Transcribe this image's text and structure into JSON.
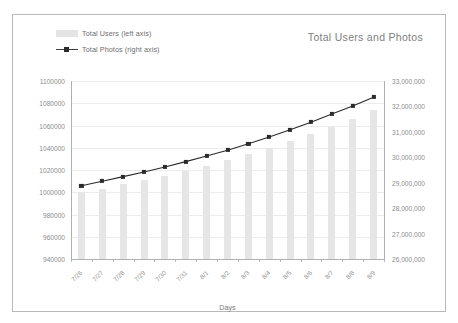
{
  "chart_data": {
    "type": "bar",
    "title": "Total Users and Photos",
    "xlabel": "Days",
    "ylabel": "",
    "grid": true,
    "legend_position": "top-left",
    "categories": [
      "7/26",
      "7/27",
      "7/28",
      "7/29",
      "7/30",
      "7/31",
      "8/1",
      "8/2",
      "8/3",
      "8/4",
      "8/5",
      "8/6",
      "8/7",
      "8/8",
      "8/9"
    ],
    "left_axis": {
      "label": "Total Users (left axis)",
      "ylim": [
        940000,
        1100000
      ],
      "ticks": [
        940000,
        960000,
        980000,
        1000000,
        1020000,
        1040000,
        1060000,
        1080000,
        1100000
      ],
      "tick_labels": [
        "940000",
        "960000",
        "980000",
        "1000000",
        "1020000",
        "1040000",
        "1060000",
        "1080000",
        "1100000"
      ]
    },
    "right_axis": {
      "label": "Total Photos (right axis)",
      "ylim": [
        26000000,
        33000000
      ],
      "ticks": [
        26000000,
        27000000,
        28000000,
        29000000,
        30000000,
        31000000,
        32000000,
        33000000
      ],
      "tick_labels": [
        "26,000,000",
        "27,000,000",
        "28,000,000",
        "29,000,000",
        "30,000,000",
        "31,000,000",
        "32,000,000",
        "33,000,000"
      ]
    },
    "series": [
      {
        "name": "Total Users (left axis)",
        "type": "bar",
        "axis": "left",
        "color": "#e6e6e6",
        "values": [
          1000000,
          1003000,
          1007000,
          1011000,
          1015000,
          1019000,
          1024000,
          1029000,
          1034000,
          1040000,
          1046000,
          1052000,
          1059000,
          1066000,
          1074000
        ]
      },
      {
        "name": "Total Photos (right axis)",
        "type": "line",
        "axis": "right",
        "color": "#2b2b2b",
        "values": [
          28880000,
          29060000,
          29240000,
          29420000,
          29620000,
          29830000,
          30050000,
          30280000,
          30530000,
          30800000,
          31080000,
          31380000,
          31700000,
          32020000,
          32360000
        ]
      }
    ]
  },
  "legend": {
    "items": [
      {
        "label": "Total Users (left axis)",
        "marker": "bar-swatch"
      },
      {
        "label": "Total Photos (right axis)",
        "marker": "line-marker"
      }
    ]
  },
  "colors": {
    "bar": "#e6e6e6",
    "line": "#2b2b2b",
    "grid": "#ececec",
    "axis": "#b0b0b0",
    "tick_text": "#8c8c8c",
    "title_text": "#808080"
  }
}
